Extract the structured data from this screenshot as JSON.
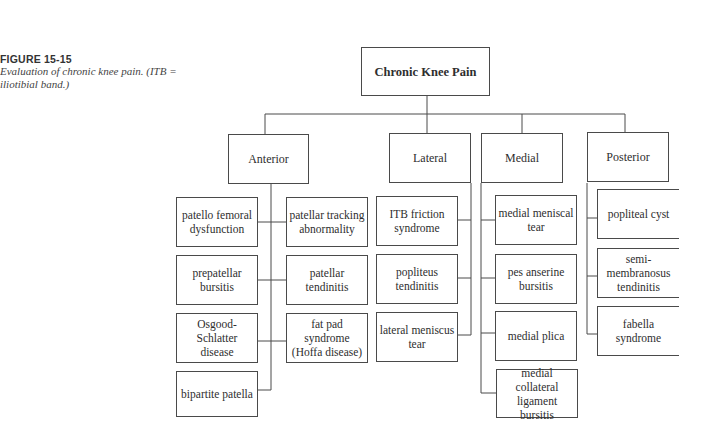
{
  "figure": {
    "label": "FIGURE 15-15",
    "description": "Evaluation of chronic knee pain. (ITB = iliotibial band.)"
  },
  "diagram": {
    "root": "Chronic Knee Pain",
    "categories": [
      {
        "name": "Anterior",
        "items": [
          "patello femoral dysfunction",
          "patellar tracking abnormality",
          "prepatellar bursitis",
          "patellar tendinitis",
          "Osgood-Schlatter disease",
          "fat pad syndrome (Hoffa disease)",
          "bipartite patella"
        ]
      },
      {
        "name": "Lateral",
        "items": [
          "ITB friction syndrome",
          "popliteus tendinitis",
          "lateral meniscus tear"
        ]
      },
      {
        "name": "Medial",
        "items": [
          "medial meniscal tear",
          "pes anserine bursitis",
          "medial plica",
          "medial collateral ligament bursitis"
        ]
      },
      {
        "name": "Posterior",
        "items": [
          "popliteal cyst",
          "semi-membranosus tendinitis",
          "fabella syndrome"
        ]
      }
    ]
  },
  "colors": {
    "line": "#4a4a4a",
    "text": "#2e2e2e",
    "background": "#ffffff"
  }
}
